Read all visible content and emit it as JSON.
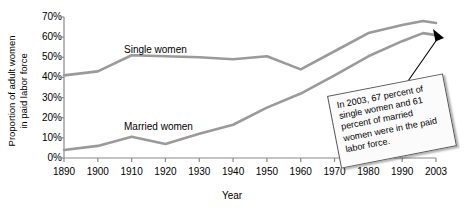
{
  "chart_data": {
    "type": "line",
    "title": "",
    "xlabel": "Year",
    "ylabel_line1": "Proportion of adult women",
    "ylabel_line2": "in paid labor force",
    "xlim": [
      1890,
      2003
    ],
    "ylim": [
      0,
      70
    ],
    "grid": false,
    "legend_position": "inline-labels",
    "x_tick_labels": [
      "1890",
      "1900",
      "1910",
      "1920",
      "1930",
      "1940",
      "1950",
      "1960",
      "1970",
      "1980",
      "1990",
      "2003"
    ],
    "x_tick_values": [
      1890,
      1900,
      1910,
      1920,
      1930,
      1940,
      1950,
      1960,
      1970,
      1980,
      1990,
      2003
    ],
    "y_tick_labels": [
      "0%",
      "10%",
      "20%",
      "30%",
      "40%",
      "50%",
      "60%",
      "70%"
    ],
    "y_tick_values": [
      0,
      10,
      20,
      30,
      40,
      50,
      60,
      70
    ],
    "series": [
      {
        "name": "Single women",
        "color": "#9a9a9a",
        "x": [
          1890,
          1900,
          1910,
          1920,
          1930,
          1940,
          1950,
          1960,
          1970,
          1980,
          1990,
          1998,
          2003
        ],
        "values": [
          41,
          43,
          51,
          50.5,
          50,
          49,
          50.5,
          44,
          53,
          62,
          66,
          68,
          67
        ]
      },
      {
        "name": "Married women",
        "color": "#9a9a9a",
        "x": [
          1890,
          1900,
          1910,
          1920,
          1930,
          1940,
          1950,
          1960,
          1970,
          1980,
          1990,
          1998,
          2003
        ],
        "values": [
          4,
          6,
          10.5,
          7,
          12,
          16.5,
          25,
          32,
          41,
          50.5,
          58,
          62,
          61
        ]
      }
    ],
    "annotations": [
      {
        "name": "callout-2003",
        "text": "In 2003, 67 percent of single women and 61 percent of married women were in the paid labor force.",
        "points_to_x": 2003,
        "points_to_y": 67
      }
    ]
  },
  "series_labels": {
    "single": "Single women",
    "married": "Married women"
  },
  "axes": {
    "x_title": "Year",
    "y_title_line1": "Proportion of adult women",
    "y_title_line2": "in paid labor force"
  },
  "callout": {
    "text": "In 2003, 67 percent of single women and 61 percent of married women were in the paid labor force."
  },
  "colors": {
    "line": "#9a9a9a",
    "axis": "#8a8a8a",
    "text": "#000000",
    "callout_bg": "#fbfbfb",
    "callout_border": "#555555"
  }
}
